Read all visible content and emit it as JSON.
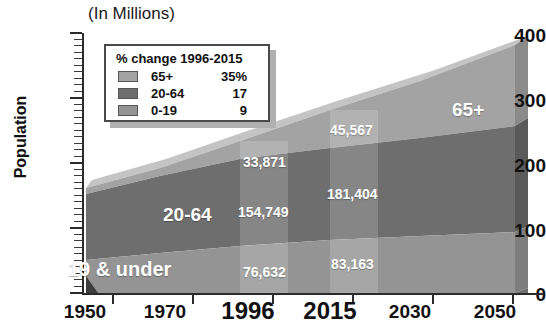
{
  "chart_title": "(In Millions)",
  "axes": {
    "ylabel": "Population",
    "yticks": [
      "0",
      "100",
      "200",
      "300",
      "400"
    ],
    "xticks": [
      "1950",
      "1970",
      "1996",
      "2015",
      "2030",
      "2050"
    ],
    "ylim": [
      0,
      400
    ]
  },
  "legend": {
    "title": "% change 1996-2015",
    "rows": [
      {
        "name": "65+",
        "value": "35%",
        "color": "#a3a3a3"
      },
      {
        "name": "20-64",
        "value": "17",
        "color": "#6e6e6e"
      },
      {
        "name": "0-19",
        "value": "9",
        "color": "#949494"
      }
    ]
  },
  "band_labels": {
    "senior": "65+",
    "adult": "20-64",
    "youth": "19 & under"
  },
  "value_labels": {
    "y1996": {
      "senior": "33,871",
      "adult": "154,749",
      "youth": "76,632"
    },
    "y2015": {
      "senior": "45,567",
      "adult": "181,404",
      "youth": "83,163"
    }
  },
  "colors": {
    "senior": "#a3a3a3",
    "adult": "#6e6e6e",
    "youth": "#949494",
    "senior_side": "#8a8a8a",
    "adult_side": "#5a5a5a",
    "youth_side": "#7d7d7d",
    "senior_top": "#c4c4c4",
    "axis": "#2b2b2b",
    "highlight": "#ffffff"
  },
  "chart_data": {
    "type": "area",
    "title": "(In Millions)",
    "xlabel": "",
    "ylabel": "Population",
    "ylim": [
      0,
      400
    ],
    "grid": false,
    "legend_position": "upper-left",
    "x": [
      "1950",
      "1970",
      "1996",
      "2015",
      "2030",
      "2050"
    ],
    "series": [
      {
        "name": "0-19",
        "values": [
          51,
          70,
          76.632,
          83.163,
          90,
          101
        ]
      },
      {
        "name": "20-64",
        "values": [
          84,
          110,
          154.749,
          181.404,
          186,
          194
        ]
      },
      {
        "name": "65+",
        "values": [
          12,
          20,
          33.871,
          45.567,
          69,
          79
        ]
      }
    ],
    "stacked_totals": [
      147,
      200,
      265.252,
      310.134,
      345,
      374
    ],
    "annotations": [
      {
        "x": "1996",
        "series": "65+",
        "text": "33,871"
      },
      {
        "x": "1996",
        "series": "20-64",
        "text": "154,749"
      },
      {
        "x": "1996",
        "series": "0-19",
        "text": "76,632"
      },
      {
        "x": "2015",
        "series": "65+",
        "text": "45,567"
      },
      {
        "x": "2015",
        "series": "20-64",
        "text": "181,404"
      },
      {
        "x": "2015",
        "series": "0-19",
        "text": "83,163"
      }
    ]
  }
}
